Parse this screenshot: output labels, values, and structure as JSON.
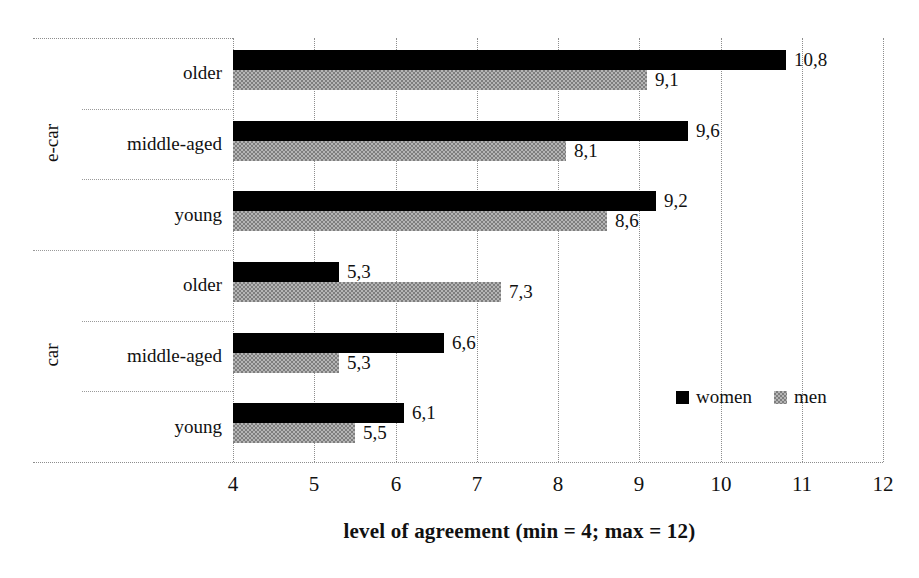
{
  "chart_data": {
    "type": "bar",
    "orientation": "horizontal",
    "title": "",
    "xlabel": "level of agreement (min = 4; max = 12)",
    "ylabel": "",
    "xlim": [
      4,
      12
    ],
    "xticks": [
      "4",
      "5",
      "6",
      "7",
      "8",
      "9",
      "10",
      "11",
      "12"
    ],
    "grid": "vertical-dotted",
    "legend_position": "inside-lower-right",
    "decimal_separator": ",",
    "groups": [
      {
        "name": "e-car",
        "categories": [
          "older",
          "middle-aged",
          "young"
        ]
      },
      {
        "name": "car",
        "categories": [
          "older",
          "middle-aged",
          "young"
        ]
      }
    ],
    "categories": [
      "e-car / older",
      "e-car / middle-aged",
      "e-car / young",
      "car / older",
      "car / middle-aged",
      "car / young"
    ],
    "series": [
      {
        "name": "women",
        "color": "#000000",
        "values": [
          10.8,
          9.6,
          9.2,
          5.3,
          6.6,
          6.1
        ],
        "labels": [
          "10,8",
          "9,6",
          "9,2",
          "5,3",
          "6,6",
          "6,1"
        ]
      },
      {
        "name": "men",
        "color": "#a8a8a8",
        "values": [
          9.1,
          8.1,
          8.6,
          7.3,
          5.3,
          5.5
        ],
        "labels": [
          "9,1",
          "8,1",
          "8,6",
          "7,3",
          "5,3",
          "5,5"
        ]
      }
    ]
  },
  "axis": {
    "ticks": [
      {
        "label": "4"
      },
      {
        "label": "5"
      },
      {
        "label": "6"
      },
      {
        "label": "7"
      },
      {
        "label": "8"
      },
      {
        "label": "9"
      },
      {
        "label": "10"
      },
      {
        "label": "11"
      },
      {
        "label": "12"
      }
    ],
    "title": "level of agreement (min = 4; max = 12)"
  },
  "legend": {
    "items": [
      {
        "label": "women",
        "swatch": "black-square-icon"
      },
      {
        "label": "men",
        "swatch": "gray-square-icon"
      }
    ]
  },
  "rows": [
    {
      "group": "e-car",
      "category": "older",
      "women": "10,8",
      "men": "9,1"
    },
    {
      "group": "e-car",
      "category": "middle-aged",
      "women": "9,6",
      "men": "8,1"
    },
    {
      "group": "e-car",
      "category": "young",
      "women": "9,2",
      "men": "8,6"
    },
    {
      "group": "car",
      "category": "older",
      "women": "5,3",
      "men": "7,3"
    },
    {
      "group": "car",
      "category": "middle-aged",
      "women": "6,6",
      "men": "5,3"
    },
    {
      "group": "car",
      "category": "young",
      "women": "6,1",
      "men": "5,5"
    }
  ],
  "group_labels": [
    {
      "text": "e-car"
    },
    {
      "text": "car"
    }
  ],
  "category_labels": [
    {
      "text": "older"
    },
    {
      "text": "middle-aged"
    },
    {
      "text": "young"
    },
    {
      "text": "older"
    },
    {
      "text": "middle-aged"
    },
    {
      "text": "young"
    }
  ]
}
